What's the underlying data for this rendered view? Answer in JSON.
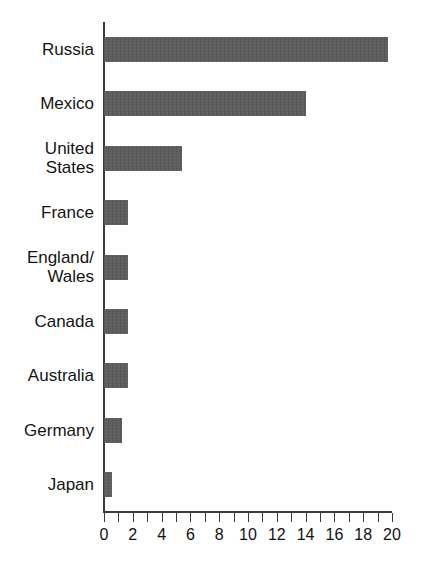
{
  "chart_data": {
    "type": "bar",
    "orientation": "horizontal",
    "title": "",
    "subtitle": "",
    "xlabel": "",
    "ylabel": "",
    "xlim": [
      0,
      20
    ],
    "ylim": null,
    "grid": false,
    "legend": null,
    "bar_color": "#595959",
    "axis_color": "#3a3a3a",
    "tick_step": 1,
    "tick_label_step": 2,
    "categories": [
      "Russia",
      "Mexico",
      "United\nStates",
      "France",
      "England/\nWales",
      "Canada",
      "Australia",
      "Germany",
      "Japan"
    ],
    "values": [
      19.7,
      14.0,
      5.4,
      1.7,
      1.7,
      1.7,
      1.7,
      1.25,
      0.55
    ],
    "x_tick_labels": [
      "0",
      "2",
      "4",
      "6",
      "8",
      "10",
      "12",
      "14",
      "16",
      "18",
      "20"
    ],
    "x_tick_values": [
      0,
      2,
      4,
      6,
      8,
      10,
      12,
      14,
      16,
      18,
      20
    ],
    "x_minor_tick_values": [
      0,
      1,
      2,
      3,
      4,
      5,
      6,
      7,
      8,
      9,
      10,
      11,
      12,
      13,
      14,
      15,
      16,
      17,
      18,
      19,
      20
    ]
  }
}
